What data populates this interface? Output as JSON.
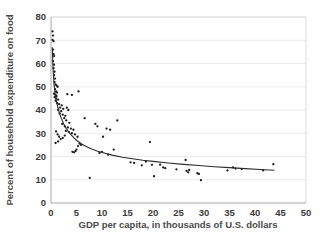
{
  "chart_data": {
    "type": "scatter",
    "title": "",
    "xlabel": "GDP per capita, in thousands of U.S. dollars",
    "ylabel": "Percent of household expenditure on food",
    "xlim": [
      0,
      50
    ],
    "ylim": [
      0,
      80
    ],
    "xticks": [
      0,
      5,
      10,
      15,
      20,
      25,
      30,
      35,
      40,
      45,
      50
    ],
    "yticks": [
      0,
      10,
      20,
      30,
      40,
      50,
      60,
      70,
      80
    ],
    "xtick_labels": [
      "0",
      "5",
      "10",
      "15",
      "20",
      "25",
      "30",
      "35",
      "40",
      "45",
      "50"
    ],
    "ytick_labels": [
      "0",
      "10",
      "20",
      "30",
      "40",
      "50",
      "60",
      "70",
      "80"
    ],
    "grid": "horizontal",
    "legend": "none",
    "marker_color": "#1c1c1c",
    "curve_color": "#2b2b2b",
    "grid_color": "#eceaea",
    "axis_color": "#a8a8a8",
    "text_color": "#3a3a3a",
    "background": "#ffffff",
    "points": [
      [
        0.3,
        73.8
      ],
      [
        0.4,
        72.0
      ],
      [
        0.3,
        70.2
      ],
      [
        0.5,
        69.6
      ],
      [
        0.4,
        66.0
      ],
      [
        0.5,
        64.0
      ],
      [
        0.6,
        63.2
      ],
      [
        0.4,
        61.0
      ],
      [
        0.6,
        59.5
      ],
      [
        0.5,
        58.0
      ],
      [
        0.7,
        56.5
      ],
      [
        0.6,
        55.0
      ],
      [
        0.8,
        53.5
      ],
      [
        0.7,
        52.0
      ],
      [
        0.9,
        51.0
      ],
      [
        1.1,
        50.5
      ],
      [
        1.3,
        50.0
      ],
      [
        0.8,
        49.0
      ],
      [
        1.0,
        48.0
      ],
      [
        1.2,
        47.5
      ],
      [
        0.6,
        47.0
      ],
      [
        0.9,
        46.5
      ],
      [
        1.1,
        46.0
      ],
      [
        0.7,
        45.5
      ],
      [
        1.0,
        45.0
      ],
      [
        1.4,
        44.5
      ],
      [
        0.9,
        44.0
      ],
      [
        1.2,
        43.0
      ],
      [
        1.6,
        42.5
      ],
      [
        2.1,
        42.0
      ],
      [
        1.8,
        41.0
      ],
      [
        2.4,
        40.5
      ],
      [
        1.4,
        40.0
      ],
      [
        2.0,
        39.5
      ],
      [
        1.7,
        38.5
      ],
      [
        2.3,
        38.0
      ],
      [
        2.8,
        37.5
      ],
      [
        3.1,
        41.0
      ],
      [
        3.4,
        40.0
      ],
      [
        2.6,
        36.5
      ],
      [
        3.0,
        35.5
      ],
      [
        3.6,
        34.5
      ],
      [
        2.2,
        34.0
      ],
      [
        2.7,
        33.0
      ],
      [
        3.3,
        32.5
      ],
      [
        3.9,
        32.0
      ],
      [
        4.4,
        31.5
      ],
      [
        2.9,
        31.0
      ],
      [
        3.5,
        30.5
      ],
      [
        4.1,
        30.0
      ],
      [
        1.0,
        30.8
      ],
      [
        1.3,
        29.5
      ],
      [
        1.6,
        28.5
      ],
      [
        0.9,
        25.8
      ],
      [
        1.4,
        26.5
      ],
      [
        1.9,
        27.5
      ],
      [
        2.3,
        28.0
      ],
      [
        2.7,
        29.0
      ],
      [
        4.7,
        29.5
      ],
      [
        5.2,
        28.5
      ],
      [
        3.2,
        46.8
      ],
      [
        4.1,
        46.5
      ],
      [
        5.4,
        48.0
      ],
      [
        6.6,
        36.5
      ],
      [
        8.7,
        34.0
      ],
      [
        9.1,
        33.0
      ],
      [
        10.9,
        32.0
      ],
      [
        11.6,
        31.5
      ],
      [
        13.0,
        35.5
      ],
      [
        10.2,
        28.5
      ],
      [
        4.2,
        22.0
      ],
      [
        4.5,
        21.8
      ],
      [
        4.8,
        22.3
      ],
      [
        5.0,
        23.0
      ],
      [
        5.3,
        24.5
      ],
      [
        5.6,
        25.5
      ],
      [
        5.9,
        25.0
      ],
      [
        7.6,
        10.8
      ],
      [
        9.5,
        21.5
      ],
      [
        10.0,
        22.0
      ],
      [
        11.2,
        20.8
      ],
      [
        12.3,
        23.0
      ],
      [
        15.6,
        17.5
      ],
      [
        16.3,
        17.2
      ],
      [
        17.8,
        16.2
      ],
      [
        18.6,
        17.8
      ],
      [
        19.4,
        26.2
      ],
      [
        19.8,
        16.4
      ],
      [
        20.2,
        11.5
      ],
      [
        21.4,
        16.5
      ],
      [
        22.0,
        15.3
      ],
      [
        22.4,
        15.0
      ],
      [
        24.6,
        14.5
      ],
      [
        26.4,
        18.5
      ],
      [
        26.6,
        13.8
      ],
      [
        26.9,
        13.2
      ],
      [
        27.1,
        14.2
      ],
      [
        28.7,
        12.8
      ],
      [
        29.0,
        12.5
      ],
      [
        29.4,
        9.8
      ],
      [
        34.6,
        14.0
      ],
      [
        35.7,
        15.3
      ],
      [
        36.2,
        14.8
      ],
      [
        37.4,
        14.6
      ],
      [
        41.6,
        14.0
      ],
      [
        43.6,
        16.7
      ]
    ],
    "fit_curve": {
      "description": "decreasing power/exponential fit",
      "points": [
        [
          0.25,
          67.0
        ],
        [
          0.4,
          58.0
        ],
        [
          0.6,
          51.0
        ],
        [
          0.8,
          47.0
        ],
        [
          1.0,
          44.5
        ],
        [
          1.3,
          41.5
        ],
        [
          1.6,
          39.0
        ],
        [
          2.0,
          36.5
        ],
        [
          2.5,
          34.0
        ],
        [
          3.0,
          32.0
        ],
        [
          3.5,
          30.5
        ],
        [
          4.0,
          29.2
        ],
        [
          4.5,
          28.0
        ],
        [
          5.0,
          27.0
        ],
        [
          6.0,
          25.4
        ],
        [
          7.0,
          24.2
        ],
        [
          8.0,
          23.2
        ],
        [
          9.0,
          22.4
        ],
        [
          10.0,
          21.7
        ],
        [
          12.0,
          20.6
        ],
        [
          14.0,
          19.7
        ],
        [
          16.0,
          19.0
        ],
        [
          18.0,
          18.4
        ],
        [
          20.0,
          17.9
        ],
        [
          23.0,
          17.2
        ],
        [
          26.0,
          16.6
        ],
        [
          29.0,
          16.1
        ],
        [
          32.0,
          15.6
        ],
        [
          35.0,
          15.2
        ],
        [
          38.0,
          14.8
        ],
        [
          41.0,
          14.4
        ],
        [
          43.8,
          14.1
        ]
      ]
    }
  },
  "layout": {
    "plot_left": 51,
    "plot_right": 306,
    "plot_top": 17,
    "plot_bottom": 203
  }
}
